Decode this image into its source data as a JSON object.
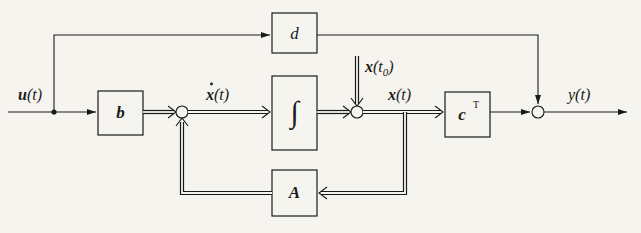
{
  "diagram": {
    "type": "state-space block diagram",
    "input_label": "u(t)",
    "output_label": "y(t)",
    "blocks": {
      "d": "d",
      "b": "b",
      "integrator": "∫",
      "c": "c",
      "c_superscript": "T",
      "A": "A"
    },
    "signals": {
      "x_dot": "ẋ(t)",
      "x_dot_base": "x",
      "x_dot_arg": "(t)",
      "x": "x",
      "x_arg": "(t)",
      "x0": "x",
      "x0_arg_open": "(t",
      "x0_sub": "0",
      "x0_arg_close": ")",
      "u_base": "u",
      "u_arg": "(t)",
      "y_base": "y",
      "y_arg": "(t)"
    },
    "connections": [
      "u(t) -> b -> sum1",
      "A -> sum1 (feedback)",
      "sum1 -> ẋ(t) -> integrator -> sum2",
      "x(t0) -> sum2",
      "sum2 -> x(t) -> cT -> sum3",
      "x(t) -> A",
      "u(t) -> d -> sum3",
      "sum3 -> y(t)"
    ],
    "colors": {
      "background": "#f6f4ee",
      "ink": "#1a1a1a"
    }
  }
}
